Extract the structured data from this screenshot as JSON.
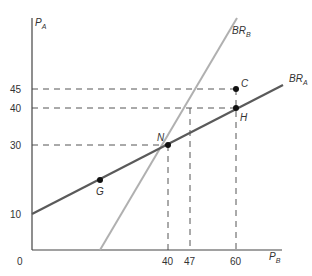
{
  "diagram": {
    "type": "best-response functions",
    "axes": {
      "x": {
        "label": "P",
        "label_sub": "B",
        "ticks": [
          "40",
          "47",
          "60"
        ],
        "origin": "0"
      },
      "y": {
        "label": "P",
        "label_sub": "A",
        "ticks": [
          "45",
          "40",
          "30",
          "10"
        ]
      }
    },
    "curves": [
      {
        "name": "BR",
        "sub": "A",
        "color": "#5a5a5a"
      },
      {
        "name": "BR",
        "sub": "B",
        "color": "#b0b0b0"
      }
    ],
    "points": [
      {
        "label": "N",
        "x": 40,
        "y": 30
      },
      {
        "label": "C",
        "x": 60,
        "y": 45
      },
      {
        "label": "H",
        "x": 60,
        "y": 40
      },
      {
        "label": "G",
        "x": 20,
        "y": 20
      }
    ],
    "guides": {
      "horizontal": [
        "45",
        "40",
        "30"
      ],
      "vertical": [
        "40",
        "47",
        "60"
      ]
    }
  }
}
